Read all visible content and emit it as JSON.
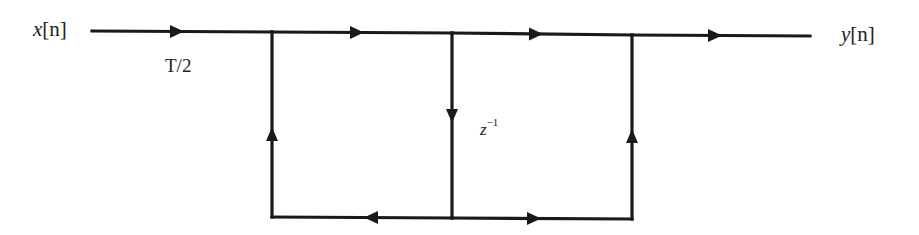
{
  "diagram": {
    "type": "signal-flow-graph",
    "input": {
      "var": "x",
      "index": "[n]"
    },
    "output": {
      "var": "y",
      "index": "[n]"
    },
    "gain_label": "T/2",
    "delay_label": {
      "base": "z",
      "exp": "−1"
    },
    "colors": {
      "line": "#1a1a1a",
      "text": "#222222",
      "background": "#ffffff"
    },
    "nodes": [
      {
        "id": "n_in",
        "x": 92,
        "y": 31
      },
      {
        "id": "n1",
        "x": 272,
        "y": 32
      },
      {
        "id": "n2",
        "x": 452,
        "y": 33
      },
      {
        "id": "n3",
        "x": 632,
        "y": 35
      },
      {
        "id": "n_out",
        "x": 810,
        "y": 36
      },
      {
        "id": "b1",
        "x": 272,
        "y": 217
      },
      {
        "id": "b2",
        "x": 452,
        "y": 218
      },
      {
        "id": "b3",
        "x": 632,
        "y": 219
      }
    ],
    "edges": [
      {
        "from": "n_in",
        "to": "n1",
        "label": "T/2",
        "arrow": "right"
      },
      {
        "from": "n1",
        "to": "n2",
        "arrow": "right"
      },
      {
        "from": "n2",
        "to": "n3",
        "arrow": "right"
      },
      {
        "from": "n3",
        "to": "n_out",
        "arrow": "right"
      },
      {
        "from": "n2",
        "to": "b2",
        "label": "z^-1",
        "arrow": "down"
      },
      {
        "from": "b2",
        "to": "b1",
        "arrow": "left"
      },
      {
        "from": "b2",
        "to": "b3",
        "arrow": "right"
      },
      {
        "from": "b1",
        "to": "n1",
        "arrow": "up"
      },
      {
        "from": "b3",
        "to": "n3",
        "arrow": "up"
      }
    ]
  }
}
